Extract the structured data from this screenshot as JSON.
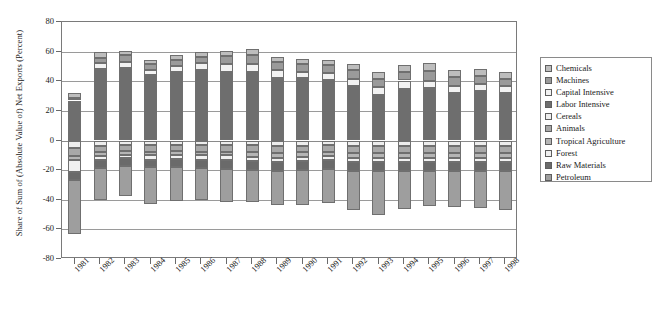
{
  "chart_data": {
    "type": "bar",
    "stacked": true,
    "title": "",
    "xlabel": "",
    "ylabel": "Share of Sum of (Absolute Value of) Net Exports (Percent)",
    "ylim": [
      -80,
      80
    ],
    "yticks": [
      80,
      60,
      40,
      20,
      0,
      -20,
      -40,
      -60,
      -80
    ],
    "grid": true,
    "legend_position": "right",
    "categories": [
      "1981",
      "1982",
      "1983",
      "1984",
      "1985",
      "1986",
      "1987",
      "1988",
      "1989",
      "1990",
      "1991",
      "1992",
      "1993",
      "1994",
      "1995",
      "1996",
      "1997",
      "1998"
    ],
    "series": [
      {
        "name": "Chemicals",
        "color": "#bdbdbd",
        "values": [
          3.0,
          3.5,
          3.0,
          3.0,
          3.5,
          3.5,
          3.5,
          4.0,
          3.5,
          3.5,
          3.5,
          4.0,
          4.5,
          4.5,
          5.0,
          4.5,
          4.5,
          4.5
        ]
      },
      {
        "name": "Machines",
        "color": "#9a9a9a",
        "values": [
          2.0,
          4.0,
          4.5,
          4.0,
          4.0,
          4.5,
          5.5,
          6.0,
          5.5,
          5.0,
          5.5,
          6.0,
          5.5,
          6.0,
          6.5,
          6.0,
          5.5,
          5.0
        ]
      },
      {
        "name": "Capital Intensive",
        "color": "#f2f2f2",
        "values": [
          2.0,
          3.5,
          4.0,
          3.5,
          4.0,
          4.5,
          5.0,
          5.5,
          5.0,
          4.5,
          4.5,
          5.0,
          5.5,
          5.5,
          5.0,
          5.0,
          4.5,
          4.5
        ]
      },
      {
        "name": "Labor Intensive",
        "color": "#6e6e6e",
        "values": [
          25.0,
          48.5,
          49.0,
          44.0,
          46.5,
          47.5,
          46.5,
          46.0,
          42.5,
          42.0,
          41.0,
          36.5,
          30.5,
          35.0,
          35.5,
          32.0,
          33.5,
          32.0
        ]
      },
      {
        "name": "Cereals",
        "color": "#ededed",
        "values": [
          -5.0,
          -3.5,
          -3.0,
          -3.0,
          -3.0,
          -3.0,
          -3.0,
          -3.0,
          -3.5,
          -3.5,
          -3.0,
          -3.5,
          -3.5,
          -3.5,
          -3.5,
          -3.5,
          -3.5,
          -3.5
        ]
      },
      {
        "name": "Animals",
        "color": "#a8a8a8",
        "values": [
          -5.5,
          -4.5,
          -4.0,
          -4.5,
          -4.0,
          -4.5,
          -4.5,
          -5.0,
          -5.0,
          -4.5,
          -4.5,
          -5.0,
          -5.0,
          -5.0,
          -5.0,
          -5.0,
          -5.0,
          -5.0
        ]
      },
      {
        "name": "Tropical Agriculture",
        "color": "#b5b5b5",
        "values": [
          -3.0,
          -2.5,
          -2.5,
          -2.5,
          -2.5,
          -2.5,
          -2.5,
          -3.0,
          -3.0,
          -3.0,
          -3.0,
          -3.0,
          -3.0,
          -3.0,
          -3.0,
          -3.0,
          -3.0,
          -3.0
        ]
      },
      {
        "name": "Forest",
        "color": "#f0f0f0",
        "values": [
          -8.0,
          -3.0,
          -2.5,
          -3.0,
          -3.0,
          -3.0,
          -3.0,
          -3.0,
          -3.0,
          -3.0,
          -3.0,
          -3.0,
          -3.0,
          -3.0,
          -3.0,
          -3.0,
          -3.0,
          -3.0
        ]
      },
      {
        "name": "Raw Materials",
        "color": "#6a6a6a",
        "values": [
          -5.5,
          -5.0,
          -5.0,
          -5.0,
          -5.5,
          -5.5,
          -6.0,
          -6.0,
          -6.0,
          -6.0,
          -6.0,
          -6.0,
          -6.0,
          -6.0,
          -6.0,
          -6.0,
          -6.0,
          -6.0
        ]
      },
      {
        "name": "Petroleum",
        "color": "#9e9e9e",
        "values": [
          -36.0,
          -22.0,
          -20.5,
          -25.0,
          -23.0,
          -21.5,
          -22.5,
          -21.5,
          -23.0,
          -23.5,
          -23.0,
          -26.5,
          -29.5,
          -25.5,
          -24.0,
          -24.5,
          -25.0,
          -26.5
        ]
      }
    ]
  },
  "legend": {
    "items": [
      {
        "label": "Chemicals"
      },
      {
        "label": "Machines"
      },
      {
        "label": "Capital Intensive"
      },
      {
        "label": "Labor Intensive"
      },
      {
        "label": "Cereals"
      },
      {
        "label": "Animals"
      },
      {
        "label": "Tropical Agriculture"
      },
      {
        "label": "Forest"
      },
      {
        "label": "Raw Materials"
      },
      {
        "label": "Petroleum"
      }
    ]
  }
}
